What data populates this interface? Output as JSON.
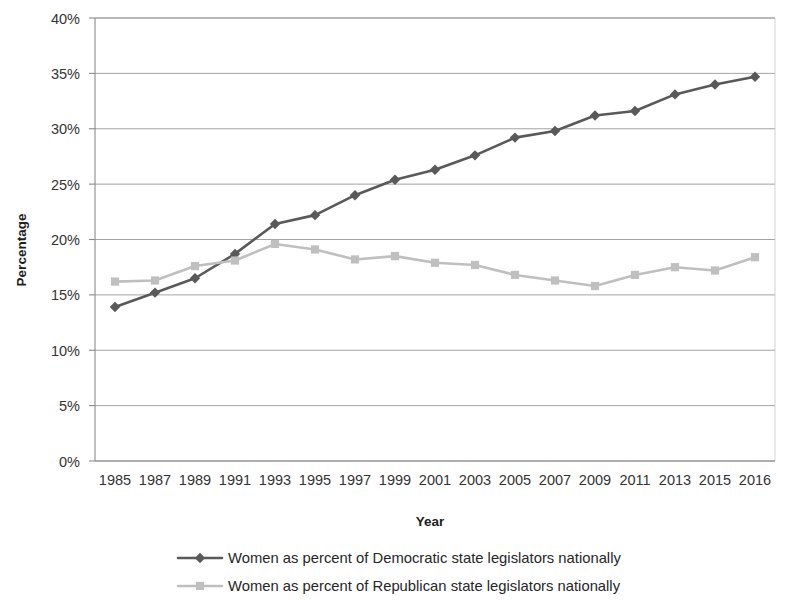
{
  "chart_data": {
    "type": "line",
    "title": "",
    "xlabel": "Year",
    "ylabel": "Percentage",
    "categories": [
      "1985",
      "1987",
      "1989",
      "1991",
      "1993",
      "1995",
      "1997",
      "1999",
      "2001",
      "2003",
      "2005",
      "2007",
      "2009",
      "2011",
      "2013",
      "2015",
      "2016"
    ],
    "ylim": [
      0,
      40
    ],
    "ytick_labels": [
      "40%",
      "35%",
      "30%",
      "25%",
      "20%",
      "15%",
      "10%",
      "5%",
      "0%"
    ],
    "ytick_values": [
      40,
      35,
      30,
      25,
      20,
      15,
      10,
      5,
      0
    ],
    "grid": true,
    "legend_position": "bottom",
    "series": [
      {
        "name": "Women as percent of Democratic state legislators nationally",
        "color": "#595959",
        "marker": "diamond",
        "values": [
          13.9,
          15.2,
          16.5,
          18.7,
          21.4,
          22.2,
          24.0,
          25.4,
          26.3,
          27.6,
          29.2,
          29.8,
          31.2,
          31.6,
          33.1,
          34.0,
          34.7
        ]
      },
      {
        "name": "Women as percent of Republican state legislators nationally",
        "color": "#bfbfbf",
        "marker": "square",
        "values": [
          16.2,
          16.3,
          17.6,
          18.1,
          19.6,
          19.1,
          18.2,
          18.5,
          17.9,
          17.7,
          16.8,
          16.3,
          15.8,
          16.8,
          17.5,
          17.2,
          18.4
        ]
      }
    ]
  },
  "axes": {
    "y_title": "Percentage",
    "x_title": "Year"
  },
  "legend": {
    "entries": [
      {
        "label": "Women as percent of Democratic state legislators nationally",
        "color": "#595959",
        "marker": "diamond"
      },
      {
        "label": "Women as percent of Republican state legislators nationally",
        "color": "#bfbfbf",
        "marker": "square"
      }
    ]
  }
}
